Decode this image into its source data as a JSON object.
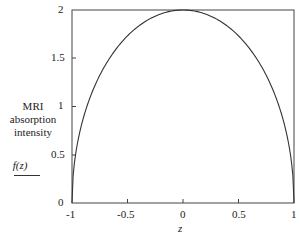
{
  "chart_data": {
    "type": "line",
    "title": "",
    "xlabel": "z",
    "ylabel": "MRI absorption intensity f(z)",
    "ylabel_lines": [
      "MRI",
      "absorption",
      "intensity"
    ],
    "ylabel_func": "f(z)",
    "xlim": [
      -1,
      1
    ],
    "ylim": [
      0,
      2
    ],
    "xticks": [
      "-1",
      "-0.5",
      "0",
      "0.5",
      "1"
    ],
    "yticks": [
      "0",
      "0.5",
      "1",
      "1.5",
      "2"
    ],
    "grid": false,
    "legend": null,
    "series": [
      {
        "name": "f(z)",
        "formula": "f(z) = 2*sqrt(1 - z^2)",
        "x": [
          -1,
          -0.9,
          -0.8,
          -0.6,
          -0.4,
          -0.2,
          0,
          0.2,
          0.4,
          0.6,
          0.8,
          0.9,
          1
        ],
        "y": [
          0,
          0.87,
          1.2,
          1.6,
          1.83,
          1.96,
          2,
          1.96,
          1.83,
          1.6,
          1.2,
          0.87,
          0
        ]
      }
    ],
    "line_color": "#333333"
  }
}
